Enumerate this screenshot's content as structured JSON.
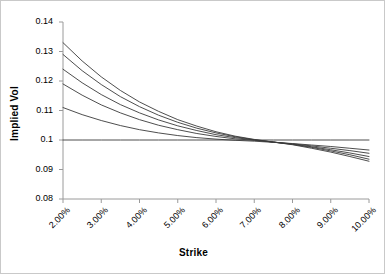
{
  "chart_data": {
    "type": "line",
    "title": "",
    "xlabel": "Strike",
    "ylabel": "Implied Vol",
    "xlim": [
      0.02,
      0.1
    ],
    "ylim": [
      0.08,
      0.14
    ],
    "grid": false,
    "legend": "none",
    "x_tick_labels": [
      "2.00%",
      "3.00%",
      "4.00%",
      "5.00%",
      "6.00%",
      "7.00%",
      "8.00%",
      "9.00%",
      "10.00%"
    ],
    "x_tick_values": [
      0.02,
      0.03,
      0.04,
      0.05,
      0.06,
      0.07,
      0.08,
      0.09,
      0.1
    ],
    "y_tick_labels": [
      "0.14",
      "0.13",
      "0.12",
      "0.11",
      "0.1",
      "0.09",
      "0.08"
    ],
    "y_tick_values": [
      0.14,
      0.13,
      0.12,
      0.11,
      0.1,
      0.09,
      0.08
    ],
    "x": [
      0.02,
      0.025,
      0.03,
      0.035,
      0.04,
      0.045,
      0.05,
      0.055,
      0.06,
      0.065,
      0.07,
      0.075,
      0.08,
      0.085,
      0.09,
      0.095,
      0.1
    ],
    "series": [
      {
        "name": "skew-0",
        "color": "#3a3a3a",
        "values": [
          0.1,
          0.1,
          0.1,
          0.1,
          0.1,
          0.1,
          0.1,
          0.1,
          0.1,
          0.1,
          0.1,
          0.1,
          0.1,
          0.1,
          0.1,
          0.1,
          0.1
        ]
      },
      {
        "name": "skew-1",
        "color": "#3a3a3a",
        "values": [
          0.111,
          0.1086,
          0.1066,
          0.1049,
          0.1035,
          0.1024,
          0.1015,
          0.1008,
          0.1003,
          0.0999,
          0.0996,
          0.0992,
          0.0988,
          0.0983,
          0.0978,
          0.0972,
          0.0966
        ]
      },
      {
        "name": "skew-2",
        "color": "#3a3a3a",
        "values": [
          0.119,
          0.1152,
          0.1119,
          0.1092,
          0.1069,
          0.105,
          0.1035,
          0.1022,
          0.1012,
          0.1004,
          0.0999,
          0.0993,
          0.0987,
          0.098,
          0.0972,
          0.0964,
          0.0955
        ]
      },
      {
        "name": "skew-3",
        "color": "#3a3a3a",
        "values": [
          0.124,
          0.1194,
          0.1154,
          0.112,
          0.1092,
          0.1068,
          0.1048,
          0.1032,
          0.1018,
          0.1008,
          0.1,
          0.0993,
          0.0986,
          0.0977,
          0.0967,
          0.0956,
          0.0944
        ]
      },
      {
        "name": "skew-4",
        "color": "#3a3a3a",
        "values": [
          0.129,
          0.1235,
          0.1188,
          0.1147,
          0.1113,
          0.1084,
          0.106,
          0.104,
          0.1024,
          0.1011,
          0.1001,
          0.0993,
          0.0985,
          0.0975,
          0.0963,
          0.095,
          0.0935
        ]
      },
      {
        "name": "skew-5",
        "color": "#3a3a3a",
        "values": [
          0.133,
          0.1268,
          0.1214,
          0.1168,
          0.1129,
          0.1097,
          0.1069,
          0.1047,
          0.1028,
          0.1013,
          0.1002,
          0.0993,
          0.0984,
          0.0972,
          0.0959,
          0.0944,
          0.0928
        ]
      }
    ]
  },
  "axis": {
    "y_title": "Implied Vol",
    "x_title": "Strike"
  }
}
